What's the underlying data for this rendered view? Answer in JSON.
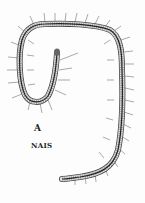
{
  "figure": {
    "letter": "A",
    "caption": "NAIS",
    "ink_color": "#333333",
    "background": "#fdfdfd"
  }
}
